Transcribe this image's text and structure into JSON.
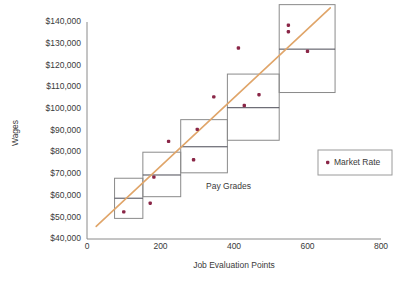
{
  "chart_data": {
    "type": "scatter",
    "title": "",
    "xlabel": "Job Evaluation Points",
    "ylabel": "Wages",
    "xlim": [
      0,
      800
    ],
    "ylim": [
      40000,
      140000
    ],
    "grid": false,
    "legend_position": "right-middle",
    "x_ticks": [
      0,
      200,
      400,
      600,
      800
    ],
    "x_tick_labels": [
      "0",
      "200",
      "400",
      "600",
      "800"
    ],
    "y_ticks": [
      40000,
      50000,
      60000,
      70000,
      80000,
      90000,
      100000,
      110000,
      120000,
      130000,
      140000
    ],
    "y_tick_labels": [
      "$40,000",
      "$50,000",
      "$60,000",
      "$70,000",
      "$80,000",
      "$90,000",
      "$100,000",
      "$110,000",
      "$120,000",
      "$130,000",
      "$140,000"
    ],
    "annotations": [
      {
        "text": "Pay Grades",
        "x": 385,
        "y": 63000
      }
    ],
    "legend": [
      {
        "label": "Market Rate",
        "color": "#8a2647",
        "marker": "square"
      }
    ],
    "series": [
      {
        "name": "Market Rate",
        "type": "scatter",
        "color": "#8a2647",
        "points": [
          {
            "x": 100,
            "y": 52500
          },
          {
            "x": 172,
            "y": 56500
          },
          {
            "x": 182,
            "y": 68500
          },
          {
            "x": 222,
            "y": 85000
          },
          {
            "x": 290,
            "y": 76500
          },
          {
            "x": 300,
            "y": 90500
          },
          {
            "x": 345,
            "y": 105500
          },
          {
            "x": 412,
            "y": 128000
          },
          {
            "x": 428,
            "y": 101500
          },
          {
            "x": 468,
            "y": 106500
          },
          {
            "x": 548,
            "y": 138500
          },
          {
            "x": 548,
            "y": 135500
          },
          {
            "x": 600,
            "y": 126500
          }
        ]
      },
      {
        "name": "Trend Line",
        "type": "line",
        "color": "#e0a569",
        "points": [
          {
            "x": 25,
            "y": 45800
          },
          {
            "x": 662,
            "y": 146500
          }
        ]
      }
    ],
    "pay_grades": [
      {
        "label": "Grade 1",
        "x_min": 75,
        "x_max": 152,
        "y_min": 49500,
        "y_max": 68000,
        "midpoint": 58800
      },
      {
        "label": "Grade 2",
        "x_min": 152,
        "x_max": 255,
        "y_min": 59500,
        "y_max": 80000,
        "midpoint": 69500
      },
      {
        "label": "Grade 3",
        "x_min": 255,
        "x_max": 382,
        "y_min": 70500,
        "y_max": 95000,
        "midpoint": 82500
      },
      {
        "label": "Grade 4",
        "x_min": 382,
        "x_max": 523,
        "y_min": 85500,
        "y_max": 116000,
        "midpoint": 100500
      },
      {
        "label": "Grade 5",
        "x_min": 523,
        "x_max": 675,
        "y_min": 107500,
        "y_max": 148000,
        "midpoint": 127500
      }
    ]
  }
}
